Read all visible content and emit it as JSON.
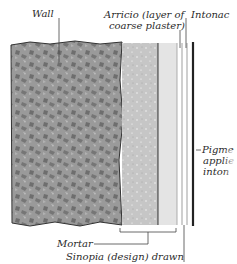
{
  "diagram": {
    "labels": {
      "wall": "Wall",
      "arricio_1": "Arricio (layer of",
      "arricio_2": "coarse plaster)",
      "intonaco": "Intonac",
      "pigment_1": "Pigme",
      "pigment_2": "applie",
      "pigment_3": "inton",
      "mortar": "Mortar",
      "sinopia": "Sinopia (design) drawn"
    },
    "colors": {
      "wall": "#8a8a8a",
      "arricio": "#c9c9c9",
      "intonaco": "#e6e6e6",
      "pigment": "#333333"
    }
  }
}
